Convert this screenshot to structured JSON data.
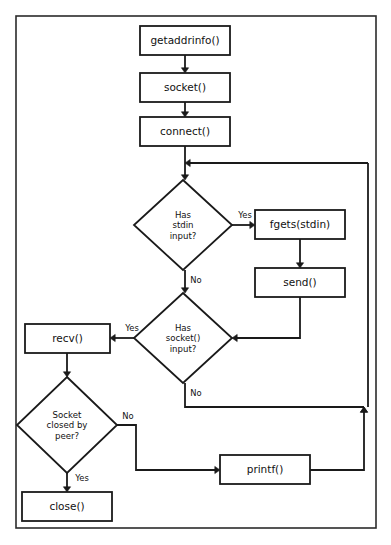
{
  "diagram": {
    "frame": {
      "x": 16,
      "y": 16,
      "width": 360,
      "height": 512
    },
    "colors": {
      "stroke": "#1a1a1a",
      "fill": "#ffffff",
      "frame_stroke": "#2b2b2b",
      "text": "#111111"
    },
    "nodes": [
      {
        "id": "getaddrinfo",
        "type": "process",
        "label": "getaddrinfo()",
        "x": 140,
        "y": 26,
        "width": 90,
        "height": 29
      },
      {
        "id": "socket",
        "type": "process",
        "label": "socket()",
        "x": 140,
        "y": 73,
        "width": 90,
        "height": 29
      },
      {
        "id": "connect",
        "type": "process",
        "label": "connect()",
        "x": 140,
        "y": 117,
        "width": 90,
        "height": 29
      },
      {
        "id": "fgets",
        "type": "process",
        "label": "fgets(stdin)",
        "x": 255,
        "y": 210,
        "width": 90,
        "height": 29
      },
      {
        "id": "send",
        "type": "process",
        "label": "send()",
        "x": 255,
        "y": 268,
        "width": 90,
        "height": 29
      },
      {
        "id": "recv",
        "type": "process",
        "label": "recv()",
        "x": 25,
        "y": 324,
        "width": 85,
        "height": 29
      },
      {
        "id": "printf",
        "type": "process",
        "label": "printf()",
        "x": 220,
        "y": 455,
        "width": 90,
        "height": 29
      },
      {
        "id": "close",
        "type": "process",
        "label": "close()",
        "x": 22,
        "y": 492,
        "width": 90,
        "height": 29
      }
    ],
    "decisions": [
      {
        "id": "has-stdin-input",
        "type": "decision",
        "cx": 183,
        "cy": 225,
        "rx": 49,
        "ry": 45,
        "lines": [
          "Has",
          "stdin",
          "input?"
        ]
      },
      {
        "id": "has-socket-input",
        "type": "decision",
        "cx": 183,
        "cy": 338,
        "rx": 49,
        "ry": 45,
        "lines": [
          "Has",
          "socket()",
          "input?"
        ]
      },
      {
        "id": "socket-closed-by-peer",
        "type": "decision",
        "cx": 67,
        "cy": 425,
        "rx": 50,
        "ry": 48,
        "lines": [
          "Socket",
          "closed by",
          "peer?"
        ]
      }
    ],
    "edge_labels": [
      {
        "id": "stdin-yes",
        "text": "Yes",
        "x": 245,
        "y": 218
      },
      {
        "id": "stdin-no",
        "text": "No",
        "x": 196,
        "y": 283
      },
      {
        "id": "socket-yes",
        "text": "Yes",
        "x": 132,
        "y": 331
      },
      {
        "id": "socket-no",
        "text": "No",
        "x": 196,
        "y": 396
      },
      {
        "id": "peer-no",
        "text": "No",
        "x": 128,
        "y": 419
      },
      {
        "id": "peer-yes",
        "text": "Yes",
        "x": 82,
        "y": 481
      }
    ],
    "connectors": [
      {
        "id": "getaddrinfo-to-socket",
        "from": "getaddrinfo",
        "to": "socket",
        "path": "M 185 55 L 185 70",
        "arrow_at": [
          185,
          73
        ],
        "arrow_dir": "down"
      },
      {
        "id": "socket-to-connect",
        "from": "socket",
        "to": "connect",
        "path": "M 185 102 L 185 114",
        "arrow_at": [
          185,
          117
        ],
        "arrow_dir": "down"
      },
      {
        "id": "connect-to-stdin-decision",
        "from": "connect",
        "to": "has-stdin-input",
        "path": "M 185 146 L 185 177",
        "arrow_at": [
          185,
          180
        ],
        "arrow_dir": "down"
      },
      {
        "id": "loop-return-to-connect-join",
        "from": "loop-right-rail",
        "to": "connect-join",
        "path": "M 368 163 L 190 163",
        "arrow_at": [
          185,
          163
        ],
        "arrow_dir": "left"
      },
      {
        "id": "stdin-yes-to-fgets",
        "from": "has-stdin-input",
        "to": "fgets",
        "path": "M 232 225 L 252 225",
        "arrow_at": [
          255,
          225
        ],
        "arrow_dir": "right"
      },
      {
        "id": "fgets-to-send",
        "from": "fgets",
        "to": "send",
        "path": "M 300 239 L 300 265",
        "arrow_at": [
          300,
          268
        ],
        "arrow_dir": "down"
      },
      {
        "id": "send-to-socket-decision",
        "from": "send",
        "to": "has-socket-input",
        "path": "M 300 297 L 300 338 L 236 338",
        "arrow_at": [
          232,
          338
        ],
        "arrow_dir": "left"
      },
      {
        "id": "stdin-no-to-socket-decision",
        "from": "has-stdin-input",
        "to": "has-socket-input",
        "path": "M 185 270 L 185 290",
        "arrow_at": [
          185,
          293
        ],
        "arrow_dir": "down"
      },
      {
        "id": "socket-yes-to-recv",
        "from": "has-socket-input",
        "to": "recv",
        "path": "M 134 338 L 113 338",
        "arrow_at": [
          110,
          338
        ],
        "arrow_dir": "left"
      },
      {
        "id": "recv-to-peer-decision",
        "from": "recv",
        "to": "socket-closed-by-peer",
        "path": "M 67 353 L 67 374",
        "arrow_at": [
          67,
          377
        ],
        "arrow_dir": "down"
      },
      {
        "id": "socket-no-to-right-rail",
        "from": "has-socket-input",
        "to": "loop-right-rail",
        "path": "M 185 383 L 185 407 L 364 407",
        "arrow_at": [
          364,
          407
        ],
        "arrow_dir": "up"
      },
      {
        "id": "peer-no-to-printf",
        "from": "socket-closed-by-peer",
        "to": "printf",
        "path": "M 117 425 L 136 425 L 136 470 L 217 470",
        "arrow_at": [
          220,
          470
        ],
        "arrow_dir": "right"
      },
      {
        "id": "printf-to-right-rail",
        "from": "printf",
        "to": "loop-right-rail",
        "path": "M 310 470 L 364 470 L 364 410",
        "arrow_at": [
          364,
          407
        ],
        "arrow_dir": "up"
      },
      {
        "id": "right-rail-up-to-top-loop",
        "from": "loop-right-rail",
        "to": "loop-return-to-connect-join",
        "path": "M 368 407 L 368 163",
        "arrow_at": null,
        "arrow_dir": "none"
      },
      {
        "id": "peer-yes-to-close",
        "from": "socket-closed-by-peer",
        "to": "close",
        "path": "M 67 473 L 67 489",
        "arrow_at": [
          67,
          492
        ],
        "arrow_dir": "down"
      }
    ]
  }
}
